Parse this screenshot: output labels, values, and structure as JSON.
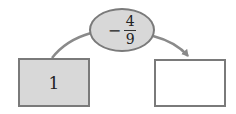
{
  "diagram": {
    "input_box": {
      "value": "1",
      "fill": "#d8d8d8"
    },
    "operator": {
      "sign": "−",
      "numerator": "4",
      "denominator": "9",
      "fill": "#d8d8d8"
    },
    "output_box": {
      "value": "",
      "fill": "#ffffff"
    },
    "connector_color": "#8a8a8a",
    "border_color": "#7a7a7a"
  }
}
